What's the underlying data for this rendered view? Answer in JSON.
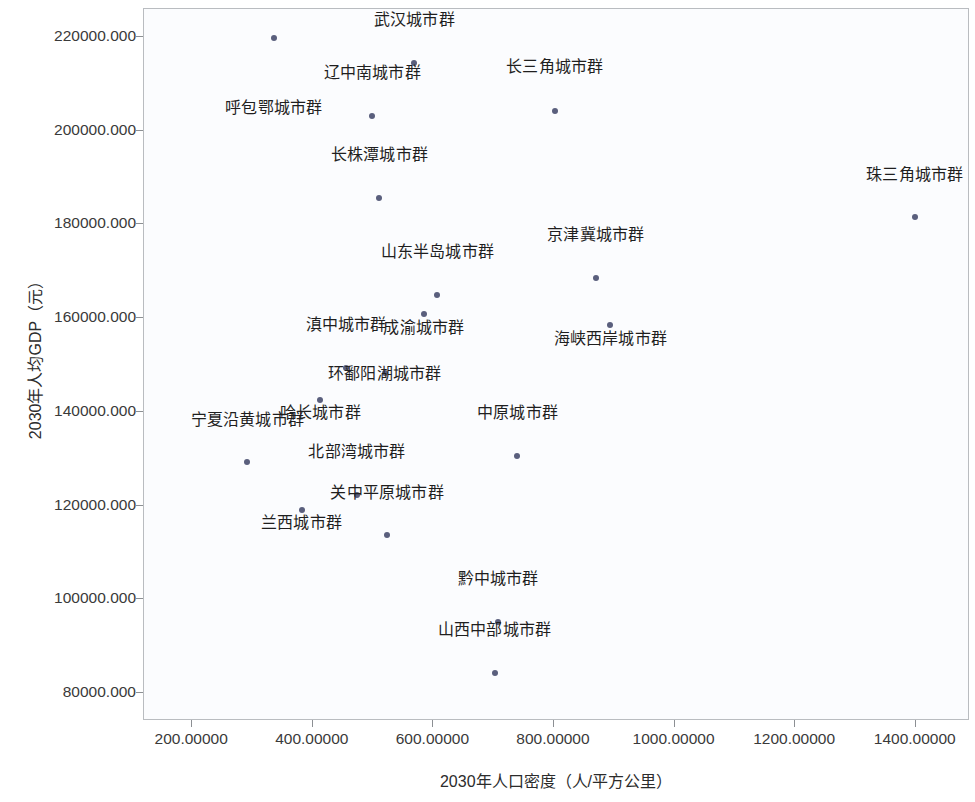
{
  "chart_data": {
    "type": "scatter",
    "title": "",
    "xlabel": "2030年人口密度（人/平方公里）",
    "ylabel": "2030年人均GDP（元）",
    "xlim": [
      120,
      1490
    ],
    "ylim": [
      74000,
      226000
    ],
    "xticks": [
      200,
      400,
      600,
      800,
      1000,
      1200,
      1400
    ],
    "xticklabels": [
      "200.00000",
      "400.00000",
      "600.00000",
      "800.00000",
      "1000.00000",
      "1200.00000",
      "1400.00000"
    ],
    "yticks": [
      80000,
      100000,
      120000,
      140000,
      160000,
      180000,
      200000,
      220000
    ],
    "yticklabels": [
      "80000.000",
      "100000.000",
      "120000.000",
      "140000.000",
      "160000.000",
      "180000.000",
      "200000.000",
      "220000.000"
    ],
    "grid": false,
    "legend": false,
    "marker_color": "#5a5f7d",
    "points": [
      {
        "label": "呼包鄂城市群",
        "x": 337,
        "y": 219600,
        "lx": 337,
        "ly": 202500
      },
      {
        "label": "武汉城市群",
        "x": 570,
        "y": 214200,
        "lx": 570,
        "ly": 221300
      },
      {
        "label": "辽中南城市群",
        "x": 500,
        "y": 203000,
        "lx": 500,
        "ly": 210000
      },
      {
        "label": "长三角城市群",
        "x": 803,
        "y": 204100,
        "lx": 803,
        "ly": 211200
      },
      {
        "label": "长株潭城市群",
        "x": 512,
        "y": 185500,
        "lx": 512,
        "ly": 192500
      },
      {
        "label": "珠三角城市群",
        "x": 1400,
        "y": 181300,
        "lx": 1400,
        "ly": 188300
      },
      {
        "label": "京津冀城市群",
        "x": 871,
        "y": 168300,
        "lx": 871,
        "ly": 175400
      },
      {
        "label": "山东半岛城市群",
        "x": 608,
        "y": 164700,
        "lx": 608,
        "ly": 171800
      },
      {
        "label": "成渝城市群",
        "x": 586,
        "y": 160600,
        "lx": 586,
        "ly": 155600
      },
      {
        "label": "海峡西岸城市群",
        "x": 895,
        "y": 158300,
        "lx": 895,
        "ly": 153200
      },
      {
        "label": "滇中城市群",
        "x": 457,
        "y": 149100,
        "lx": 457,
        "ly": 156100
      },
      {
        "label": "环鄱阳湖城市群",
        "x": 521,
        "y": 148000,
        "lx": 521,
        "ly": 145800
      },
      {
        "label": "哈长城市群",
        "x": 414,
        "y": 142300,
        "lx": 414,
        "ly": 137500
      },
      {
        "label": "中原城市群",
        "x": 741,
        "y": 130300,
        "lx": 741,
        "ly": 137300
      },
      {
        "label": "宁夏沿黄城市群",
        "x": 293,
        "y": 129000,
        "lx": 293,
        "ly": 136000
      },
      {
        "label": "北部湾城市群",
        "x": 475,
        "y": 122100,
        "lx": 475,
        "ly": 129100
      },
      {
        "label": "兰西城市群",
        "x": 383,
        "y": 118800,
        "lx": 383,
        "ly": 114000
      },
      {
        "label": "关中平原城市群",
        "x": 525,
        "y": 113400,
        "lx": 525,
        "ly": 120400
      },
      {
        "label": "黔中城市群",
        "x": 709,
        "y": 95000,
        "lx": 709,
        "ly": 102000
      },
      {
        "label": "山西中部城市群",
        "x": 703,
        "y": 84000,
        "lx": 703,
        "ly": 91000
      }
    ]
  }
}
